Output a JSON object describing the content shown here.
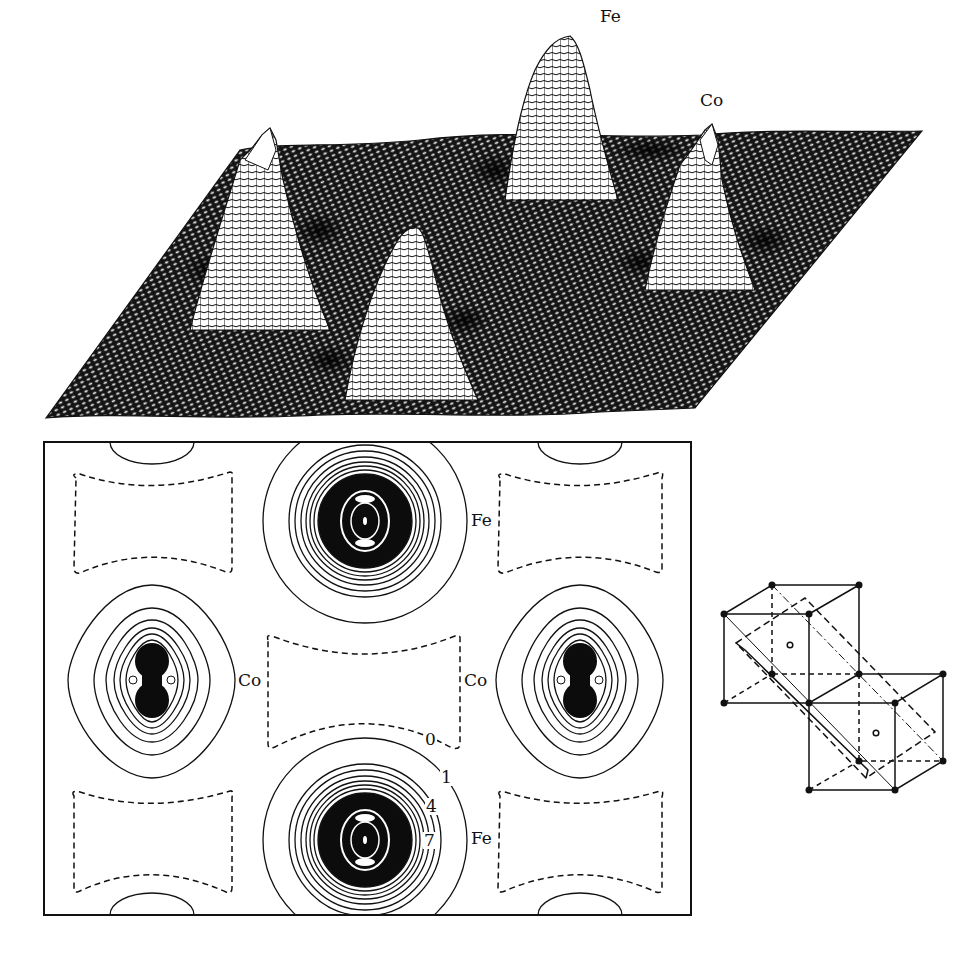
{
  "figure": {
    "surface_plot": {
      "description": "3D wireframe charge density surface with four peaks",
      "peak_labels": [
        {
          "text": "Fe",
          "x": 599,
          "y": 8
        },
        {
          "text": "Co",
          "x": 699,
          "y": 92
        }
      ],
      "colors": {
        "mesh": "#111111",
        "highlight": "#ffffff"
      }
    },
    "contour_map": {
      "description": "2D contour plot of charge density in a rectangular cell",
      "atom_labels": [
        {
          "text": "Fe",
          "x": 470,
          "y": 512
        },
        {
          "text": "Co",
          "x": 237,
          "y": 672
        },
        {
          "text": "Co",
          "x": 463,
          "y": 672
        },
        {
          "text": "Fe",
          "x": 470,
          "y": 830
        }
      ],
      "contour_values": [
        {
          "text": "0",
          "x": 424,
          "y": 731
        },
        {
          "text": "1",
          "x": 440,
          "y": 769
        },
        {
          "text": "4",
          "x": 425,
          "y": 798
        },
        {
          "text": "7",
          "x": 423,
          "y": 832
        }
      ],
      "line_styles": {
        "positive": "solid",
        "zero_or_negative": "dashed"
      }
    },
    "crystal_structure": {
      "description": "Two cubic unit cells with a diagonal cutting plane (dashed), corner atoms as filled dots, body-center atoms as open circles"
    }
  }
}
